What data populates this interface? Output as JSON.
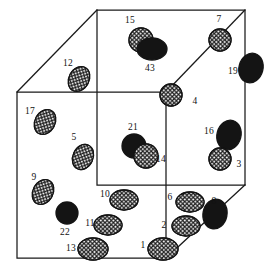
{
  "figure": {
    "kind": "3d-cube-particle-diagram",
    "width": 280,
    "height": 280,
    "background_color": "#ffffff",
    "line_color": "#1a1a1a",
    "hatched_fill_color": "#e8e8e8",
    "solid_fill_color": "#141414",
    "cube": {
      "projection": "oblique",
      "vertices": {
        "back_top_left": [
          97,
          10
        ],
        "back_top_right": [
          245,
          10
        ],
        "back_bottom_left": [
          97,
          185
        ],
        "back_bottom_right": [
          245,
          185
        ],
        "front_top_left": [
          17,
          92
        ],
        "front_top_right": [
          166,
          92
        ],
        "front_bottom_left": [
          17,
          258
        ],
        "front_bottom_right": [
          166,
          258
        ]
      }
    },
    "objects": [
      {
        "label": "15",
        "shape": "ellipse",
        "fill": "hatched",
        "cx": 141,
        "cy": 40,
        "rx": 12,
        "ry": 12,
        "rot": 0,
        "label_x": 130,
        "label_y": 21
      },
      {
        "label": "43",
        "shape": "ellipse",
        "fill": "solid",
        "cx": 152,
        "cy": 49,
        "rx": 15,
        "ry": 11,
        "rot": 0,
        "label_x": 150,
        "label_y": 69
      },
      {
        "label": "7",
        "shape": "ellipse",
        "fill": "hatched",
        "cx": 220,
        "cy": 40,
        "rx": 11,
        "ry": 11,
        "rot": 0,
        "label_x": 219,
        "label_y": 20
      },
      {
        "label": "19",
        "shape": "ellipse",
        "fill": "solid",
        "cx": 251,
        "cy": 68,
        "rx": 12,
        "ry": 15,
        "rot": 15,
        "label_x": 233,
        "label_y": 72
      },
      {
        "label": "12",
        "shape": "ellipse",
        "fill": "hatched",
        "cx": 79,
        "cy": 79,
        "rx": 10,
        "ry": 13,
        "rot": 28,
        "label_x": 68,
        "label_y": 64
      },
      {
        "label": "4",
        "shape": "ellipse",
        "fill": "hatched",
        "cx": 171,
        "cy": 95,
        "rx": 11,
        "ry": 11,
        "rot": 0,
        "label_x": 195,
        "label_y": 102
      },
      {
        "label": "17",
        "shape": "ellipse",
        "fill": "hatched",
        "cx": 45,
        "cy": 122,
        "rx": 10,
        "ry": 13,
        "rot": 28,
        "label_x": 30,
        "label_y": 112
      },
      {
        "label": "5",
        "shape": "ellipse",
        "fill": "hatched",
        "cx": 83,
        "cy": 157,
        "rx": 10,
        "ry": 13,
        "rot": 25,
        "label_x": 74,
        "label_y": 138
      },
      {
        "label": "21",
        "shape": "ellipse",
        "fill": "solid",
        "cx": 134,
        "cy": 146,
        "rx": 12,
        "ry": 12,
        "rot": 0,
        "label_x": 133,
        "label_y": 128
      },
      {
        "label": "14",
        "shape": "ellipse",
        "fill": "hatched",
        "cx": 146,
        "cy": 156,
        "rx": 12,
        "ry": 12,
        "rot": 0,
        "label_x": 161,
        "label_y": 160
      },
      {
        "label": "16",
        "shape": "ellipse",
        "fill": "solid",
        "cx": 229,
        "cy": 135,
        "rx": 12,
        "ry": 15,
        "rot": 15,
        "label_x": 209,
        "label_y": 132
      },
      {
        "label": "3",
        "shape": "ellipse",
        "fill": "hatched",
        "cx": 220,
        "cy": 159,
        "rx": 11,
        "ry": 11,
        "rot": 0,
        "label_x": 239,
        "label_y": 165
      },
      {
        "label": "9",
        "shape": "ellipse",
        "fill": "hatched",
        "cx": 43,
        "cy": 192,
        "rx": 10,
        "ry": 13,
        "rot": 28,
        "label_x": 34,
        "label_y": 178
      },
      {
        "label": "22",
        "shape": "ellipse",
        "fill": "solid",
        "cx": 67,
        "cy": 213,
        "rx": 11,
        "ry": 11,
        "rot": 0,
        "label_x": 65,
        "label_y": 233
      },
      {
        "label": "10",
        "shape": "ellipse",
        "fill": "hatched",
        "cx": 124,
        "cy": 200,
        "rx": 14,
        "ry": 10,
        "rot": 0,
        "label_x": 105,
        "label_y": 195
      },
      {
        "label": "11",
        "shape": "ellipse",
        "fill": "hatched",
        "cx": 108,
        "cy": 225,
        "rx": 14,
        "ry": 10,
        "rot": 0,
        "label_x": 90,
        "label_y": 224
      },
      {
        "label": "13",
        "shape": "ellipse",
        "fill": "hatched",
        "cx": 93,
        "cy": 249,
        "rx": 15,
        "ry": 11,
        "rot": 0,
        "label_x": 71,
        "label_y": 249
      },
      {
        "label": "1",
        "shape": "ellipse",
        "fill": "hatched",
        "cx": 163,
        "cy": 249,
        "rx": 15,
        "ry": 11,
        "rot": 0,
        "label_x": 143,
        "label_y": 246
      },
      {
        "label": "2",
        "shape": "ellipse",
        "fill": "hatched",
        "cx": 186,
        "cy": 226,
        "rx": 14,
        "ry": 10,
        "rot": 0,
        "label_x": 164,
        "label_y": 226
      },
      {
        "label": "6",
        "shape": "ellipse",
        "fill": "hatched",
        "cx": 190,
        "cy": 202,
        "rx": 14,
        "ry": 10,
        "rot": 0,
        "label_x": 170,
        "label_y": 198
      },
      {
        "label": "8",
        "shape": "ellipse",
        "fill": "solid",
        "cx": 215,
        "cy": 214,
        "rx": 12,
        "ry": 15,
        "rot": 12,
        "label_x": 214,
        "label_y": 202
      }
    ]
  }
}
